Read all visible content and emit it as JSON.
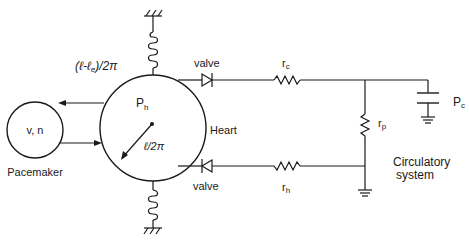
{
  "diagram": {
    "nodes": {
      "pacemaker": {
        "inner_label": "v, n",
        "caption": "Pacemaker"
      },
      "heart": {
        "inner_label": "P",
        "inner_sub": "h",
        "caption": "Heart",
        "radius_label": "ℓ/2π"
      }
    },
    "labels": {
      "spring_top": "(ℓ-ℓ",
      "spring_top_sub": "e",
      "spring_top_tail": ")/2π",
      "valve_top": "valve",
      "valve_bottom": "valve",
      "r_c": "r",
      "r_c_sub": "c",
      "r_h": "r",
      "r_h_sub": "h",
      "r_p": "r",
      "r_p_sub": "p",
      "capacitor": "P",
      "capacitor_sub": "c",
      "system_line1": "Circulatory",
      "system_line2": "system"
    },
    "colors": {
      "ink": "#1a1a1a",
      "background": "#ffffff"
    }
  }
}
